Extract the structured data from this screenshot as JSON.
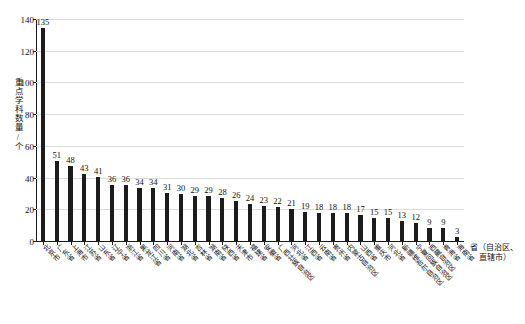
{
  "chart_data": {
    "type": "bar",
    "title": "",
    "xlabel": "省（自治区、直辖市）",
    "ylabel": "重点学科数量/个",
    "ylim": [
      0,
      140
    ],
    "yticks": [
      0,
      20,
      40,
      60,
      80,
      100,
      120,
      140
    ],
    "grid": true,
    "legend": "none",
    "bar_color": "#1c1c1c",
    "categories": [
      "北京市",
      "广东省",
      "上海市",
      "江苏省",
      "山东省",
      "辽宁省",
      "浙江省",
      "黑龙江省",
      "四川省",
      "河南省",
      "湖北省",
      "吉林省",
      "湖南省",
      "陕西省",
      "天津市",
      "福建省",
      "安徽省",
      "广西壮族自治区",
      "河北省",
      "江西省",
      "云南省",
      "贵州省",
      "内蒙古自治区",
      "山西省",
      "重庆市",
      "河北省",
      "新疆维吾尔自治区",
      "宁夏回族自治区",
      "西藏自治区",
      "青海省",
      "海南省"
    ],
    "values": [
      135,
      51,
      48,
      43,
      41,
      36,
      36,
      34,
      34,
      31,
      30,
      29,
      29,
      28,
      26,
      24,
      23,
      22,
      21,
      19,
      18,
      18,
      18,
      17,
      15,
      15,
      13,
      12,
      9,
      9,
      3
    ]
  },
  "axis": {
    "y_title": "重点学科数量/个",
    "x_title_line1": "省（自治区、",
    "x_title_line2": "直辖市）"
  }
}
